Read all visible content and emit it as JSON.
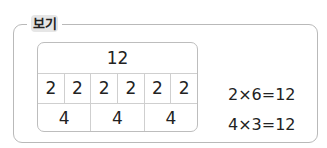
{
  "label": "보기",
  "table": {
    "total": "12",
    "row_twos": [
      "2",
      "2",
      "2",
      "2",
      "2",
      "2"
    ],
    "row_fours": [
      "4",
      "4",
      "4"
    ]
  },
  "equations": [
    "2×6=12",
    "4×3=12"
  ]
}
